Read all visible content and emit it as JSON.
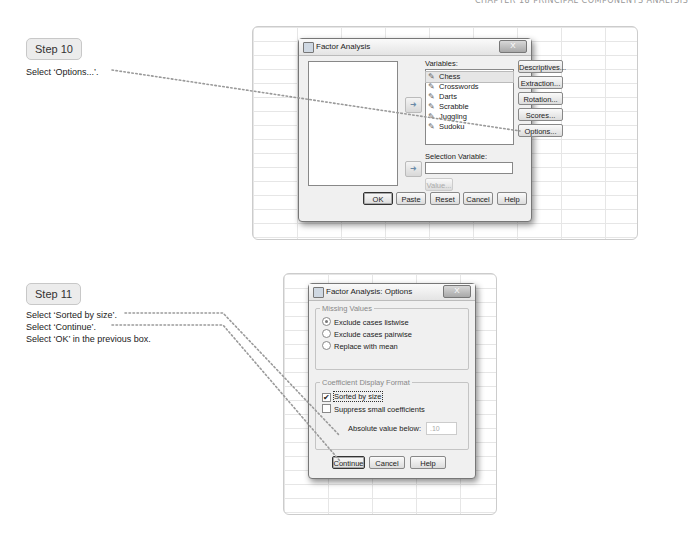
{
  "page": {
    "running_head": "CHAPTER 18 PRINCIPAL COMPONENTS ANALYSIS"
  },
  "step10": {
    "badge": "Step 10",
    "instructions": [
      "Select ‘Options...’."
    ]
  },
  "step11": {
    "badge": "Step 11",
    "instructions": [
      "Select ‘Sorted by size’.",
      "Select ‘Continue’.",
      "Select ‘OK’ in the previous box."
    ]
  },
  "factor_dialog": {
    "title": "Factor Analysis",
    "close_label": "X",
    "variables_label": "Variables:",
    "variables": [
      "Chess",
      "Crosswords",
      "Darts",
      "Scrabble",
      "Juggling",
      "Sudoku"
    ],
    "selection_variable_label": "Selection Variable:",
    "selection_variable_value": "",
    "value_button": "Value...",
    "side_buttons": [
      "Descriptives...",
      "Extraction...",
      "Rotation...",
      "Scores...",
      "Options..."
    ],
    "bottom_buttons": [
      "OK",
      "Paste",
      "Reset",
      "Cancel",
      "Help"
    ]
  },
  "options_dialog": {
    "title": "Factor Analysis: Options",
    "close_label": "X",
    "missing_values": {
      "legend": "Missing Values",
      "options": [
        "Exclude cases listwise",
        "Exclude cases pairwise",
        "Replace with mean"
      ],
      "selected": "Exclude cases listwise"
    },
    "coefficient_format": {
      "legend": "Coefficient Display Format",
      "sorted_by_size": {
        "label": "Sorted by size",
        "checked": true
      },
      "suppress_small": {
        "label": "Suppress small coefficients",
        "checked": false
      },
      "absolute_value_label": "Absolute value below:",
      "absolute_value": ".10"
    },
    "buttons": [
      "Continue",
      "Cancel",
      "Help"
    ]
  },
  "colors": {
    "leader_dots": "#9a9a9a",
    "grid_lines": "#e6e6e6",
    "dialog_bg": "#f0f0f0"
  }
}
